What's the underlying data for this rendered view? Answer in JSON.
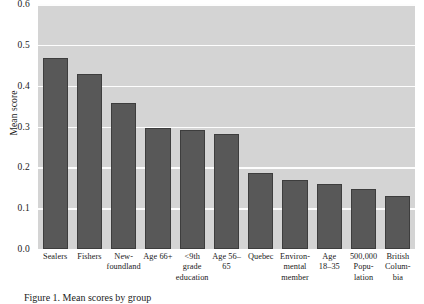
{
  "chart_data": {
    "type": "bar",
    "title": "",
    "xlabel": "",
    "ylabel": "Mean score",
    "ylim": [
      0.0,
      0.6
    ],
    "ytick_labels": [
      "0.0",
      "0.1",
      "0.2",
      "0.3",
      "0.4",
      "0.5",
      "0.6"
    ],
    "ytick_values": [
      0.0,
      0.1,
      0.2,
      0.3,
      0.4,
      0.5,
      0.6
    ],
    "grid": "horizontal",
    "legend": "none",
    "categories": [
      "Sealers",
      "Fishers",
      "New-\nfoundland",
      "Age 66+",
      "<9th\ngrade\neducation",
      "Age 56–\n65",
      "Quebec",
      "Environ-\nmental\nmember",
      "Age\n18–35",
      "500,000\nPopu-\nlation",
      "British\nColum-\nbia"
    ],
    "values": [
      0.467,
      0.428,
      0.357,
      0.297,
      0.292,
      0.282,
      0.185,
      0.169,
      0.159,
      0.148,
      0.131
    ],
    "bar_color": "#585858",
    "bar_edge_color": "#3d3d3d",
    "panel_color": "#d4d4d4",
    "gridline_color": "#fdfdfd"
  },
  "caption": {
    "text": "Figure 1. Mean scores by group"
  }
}
